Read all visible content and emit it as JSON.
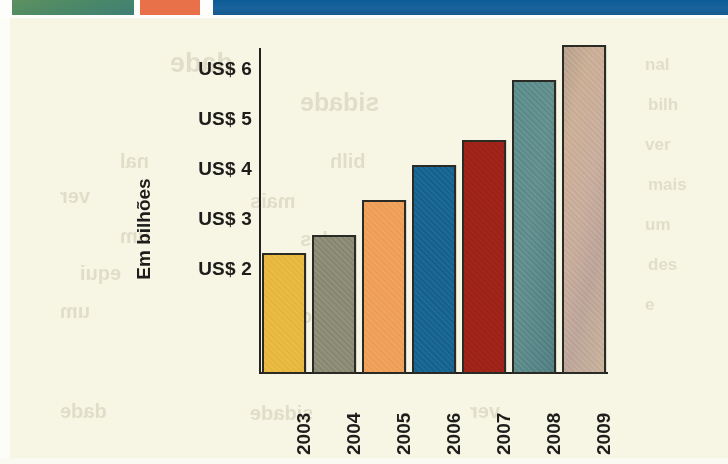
{
  "page": {
    "background_color": "#f7f6e4",
    "banner": {
      "green_block_color": "#4e8a66",
      "orange_block_color": "#e9714a",
      "blue_block_color": "#135d95"
    },
    "show_through_text": [
      "dade",
      "sidade",
      "nal",
      "bilh",
      "ver",
      "mais",
      "um",
      "des",
      "equi",
      "e",
      "um",
      "bro"
    ]
  },
  "chart_data": {
    "type": "bar",
    "title": "",
    "subtitle": "",
    "xlabel": "",
    "ylabel": "Em bilhões",
    "categories": [
      "2003",
      "2004",
      "2005",
      "2006",
      "2007",
      "2008",
      "2009"
    ],
    "values": [
      2.35,
      2.7,
      3.4,
      4.1,
      4.6,
      5.8,
      6.5
    ],
    "ytick_labels": [
      "US$ 6",
      "US$ 5",
      "US$ 4",
      "US$ 3",
      "US$ 2"
    ],
    "ytick_values": [
      6,
      5,
      4,
      3,
      2
    ],
    "ylim": [
      0,
      6.8
    ],
    "grid": false,
    "legend": null,
    "bar_colors": [
      "#e8b83f",
      "#8c8b76",
      "#f0a05a",
      "#196491",
      "#9e2318",
      "#5b8b8c",
      "#c3a692"
    ],
    "bar_border_color": "#2b2b26",
    "axis_color": "#232320",
    "annotations": []
  }
}
